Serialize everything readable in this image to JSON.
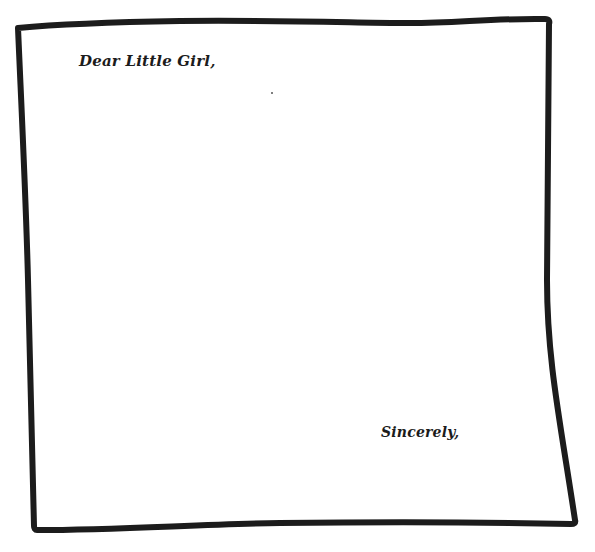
{
  "letter": {
    "greeting": "Dear Little Girl,",
    "body": "",
    "closing": "Sincerely,",
    "border_color": "#1c1c1c",
    "paper_color": "#ffffff"
  }
}
